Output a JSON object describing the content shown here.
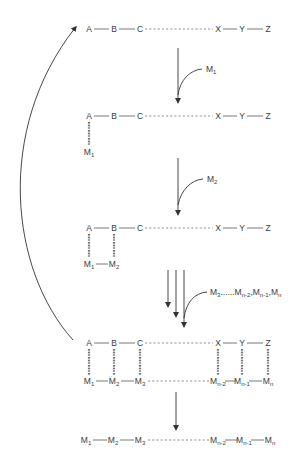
{
  "diagram": {
    "title": "",
    "colors": {
      "line": "#555555",
      "text": "#3a3a3a",
      "background": "#ffffff"
    },
    "template_row": {
      "nodes": [
        "A",
        "B",
        "C",
        "X",
        "Y",
        "Z"
      ],
      "connection_between_C_and_X": "dashed"
    },
    "steps": [
      {
        "id": "step1",
        "monomer_label": "M",
        "monomer_sub": "1",
        "bound_positions": [
          "A"
        ],
        "product": [
          [
            "M",
            "1"
          ]
        ]
      },
      {
        "id": "step2",
        "monomer_label": "M",
        "monomer_sub": "2",
        "bound_positions": [
          "A",
          "B"
        ],
        "product": [
          [
            "M",
            "1"
          ],
          [
            "M",
            "2"
          ]
        ]
      },
      {
        "id": "step3",
        "monomer_label_parts": [
          [
            "M",
            "3"
          ],
          [
            "......",
            ""
          ],
          [
            "M",
            "n-2"
          ],
          [
            ",",
            ""
          ],
          [
            "M",
            "n-1"
          ],
          [
            ",",
            ""
          ],
          [
            "M",
            "n"
          ]
        ],
        "bound_positions": [
          "A",
          "B",
          "C",
          "X",
          "Y",
          "Z"
        ],
        "product": [
          [
            "M",
            "1"
          ],
          [
            "M",
            "2"
          ],
          [
            "M",
            "3"
          ],
          [
            "M",
            "n-2"
          ],
          [
            "M",
            "n-1"
          ],
          [
            "M",
            "n"
          ]
        ]
      }
    ],
    "final_product": [
      [
        "M",
        "1"
      ],
      [
        "M",
        "2"
      ],
      [
        "M",
        "3"
      ],
      [
        "M",
        "n-2"
      ],
      [
        "M",
        "n-1"
      ],
      [
        "M",
        "n"
      ]
    ],
    "cycle_arrow": {
      "from": "template-with-full-product",
      "to": "free-template",
      "label": ""
    }
  }
}
